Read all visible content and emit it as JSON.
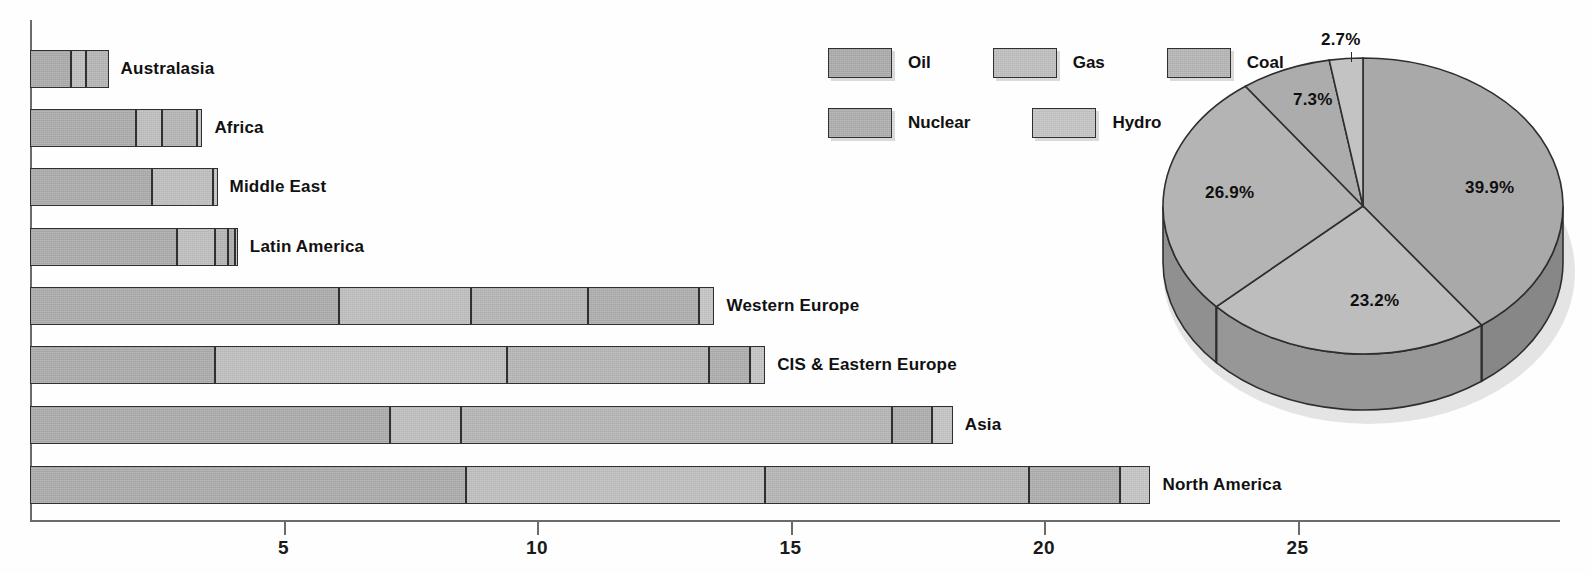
{
  "legend": {
    "rows": [
      [
        {
          "label": "Oil",
          "key": "oil",
          "color": "#a9a9a9"
        },
        {
          "label": "Gas",
          "key": "gas",
          "color": "#bdbdbd"
        },
        {
          "label": "Coal",
          "key": "coal",
          "color": "#b4b4b4"
        }
      ],
      [
        {
          "label": "Nuclear",
          "key": "nuclear",
          "color": "#acacac"
        },
        {
          "label": "Hydro",
          "key": "hydro",
          "color": "#c3c3c3"
        }
      ]
    ]
  },
  "axis": {
    "ticks": [
      {
        "value": 5,
        "label": "5"
      },
      {
        "value": 10,
        "label": "10"
      },
      {
        "value": 15,
        "label": "15"
      },
      {
        "value": 20,
        "label": "20"
      },
      {
        "value": 25,
        "label": "25"
      }
    ]
  },
  "chart_data": [
    {
      "type": "bar",
      "orientation": "horizontal",
      "stacked": true,
      "title": "",
      "xlabel": "",
      "ylabel": "",
      "xlim": [
        0,
        29.5
      ],
      "grid": false,
      "legend_position": "top-center",
      "series": [
        {
          "name": "Oil",
          "values": [
            0.8,
            2.1,
            2.4,
            2.9,
            6.1,
            3.65,
            7.1,
            8.6
          ]
        },
        {
          "name": "Gas",
          "values": [
            0.3,
            0.5,
            1.2,
            0.75,
            2.6,
            5.75,
            1.4,
            5.9
          ]
        },
        {
          "name": "Coal",
          "values": [
            0.45,
            0.7,
            0.0,
            0.25,
            2.3,
            4.0,
            8.5,
            5.2
          ]
        },
        {
          "name": "Nuclear",
          "values": [
            0.0,
            0.0,
            0.0,
            0.15,
            2.2,
            0.8,
            0.8,
            1.8
          ]
        },
        {
          "name": "Hydro",
          "values": [
            0.0,
            0.1,
            0.1,
            0.05,
            0.3,
            0.3,
            0.4,
            0.6
          ]
        }
      ],
      "categories": [
        "Australasia",
        "Africa",
        "Middle East",
        "Latin America",
        "Western Europe",
        "CIS & Eastern Europe",
        "Asia",
        "North America"
      ],
      "totals": [
        1.55,
        3.4,
        3.7,
        4.1,
        13.5,
        14.5,
        18.2,
        22.1
      ]
    },
    {
      "type": "pie",
      "title": "",
      "three_d": true,
      "labels": [
        "Oil",
        "Gas",
        "Coal",
        "Nuclear",
        "Hydro"
      ],
      "values": [
        39.9,
        23.2,
        26.9,
        7.3,
        2.7
      ],
      "value_labels": [
        "39.9%",
        "23.2%",
        "26.9%",
        "7.3%",
        "2.7%"
      ],
      "colors": [
        "#a9a9a9",
        "#bdbdbd",
        "#b4b4b4",
        "#acacac",
        "#c3c3c3"
      ],
      "start_angle_deg": 0,
      "direction": "clockwise"
    }
  ]
}
